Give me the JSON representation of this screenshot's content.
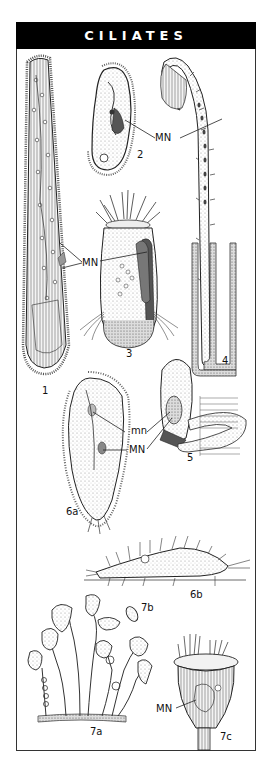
{
  "plate": {
    "title": "CILIATES",
    "colors": {
      "header_bg": "#000000",
      "header_text": "#ffffff",
      "ink": "#222222",
      "stipple": "#cfcfcf"
    }
  },
  "figures": [
    {
      "id": "1",
      "label": "1"
    },
    {
      "id": "2",
      "label": "2"
    },
    {
      "id": "3",
      "label": "3"
    },
    {
      "id": "4",
      "label": "4"
    },
    {
      "id": "5",
      "label": "5"
    },
    {
      "id": "6a",
      "label": "6a"
    },
    {
      "id": "6b",
      "label": "6b"
    },
    {
      "id": "7a",
      "label": "7a"
    },
    {
      "id": "7b",
      "label": "7b"
    },
    {
      "id": "7c",
      "label": "7c"
    }
  ],
  "annotations": {
    "mn_2_4": "MN",
    "mn_1_3": "MN",
    "mn_small_6a": "mn",
    "mn_large_6a": "MN",
    "mn_7c": "MN"
  }
}
